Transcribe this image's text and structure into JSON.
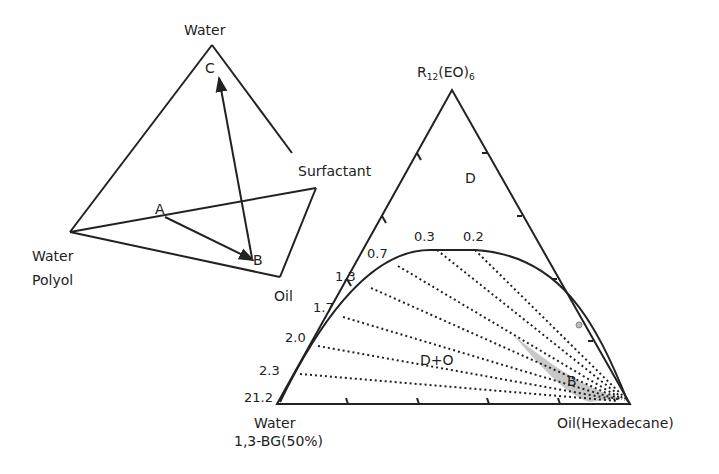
{
  "left_diagram": {
    "type": "tetrahedron",
    "vertices": {
      "top": "Water",
      "left_line1": "Water",
      "left_line2": "Polyol",
      "right": "Surfactant",
      "bottom": "Oil"
    },
    "points": [
      "A",
      "B",
      "C"
    ],
    "arrows": [
      "A → B",
      "B → C"
    ]
  },
  "right_diagram": {
    "type": "ternary phase diagram",
    "apex_label_main": "R",
    "apex_label_sub1": "12",
    "apex_label_mid": "(EO)",
    "apex_label_sub2": "6",
    "bottom_left_line1": "Water",
    "bottom_left_line2": "1,3-BG(50%)",
    "bottom_right": "Oil(Hexadecane)",
    "region_single": "D",
    "region_two_phase": "D+O",
    "region_shaded": "B",
    "tie_line_labels": [
      "0.3",
      "0.2",
      "0.7",
      "1.3",
      "1.7",
      "2.0",
      "2.3",
      "21.2"
    ]
  }
}
